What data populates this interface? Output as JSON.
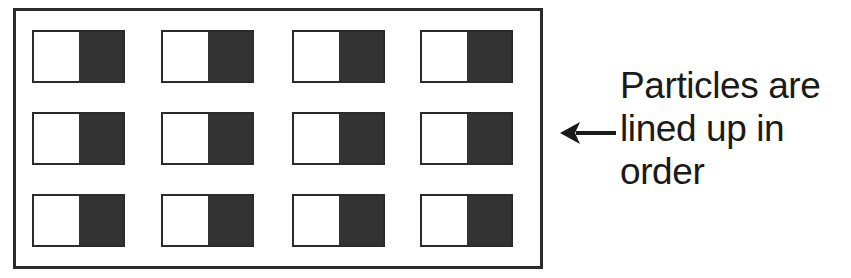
{
  "figure": {
    "background_color": "#ffffff"
  },
  "container": {
    "name": "particle-box",
    "border_color": "#2b2b2b",
    "fill_color": "#ffffff"
  },
  "particles": {
    "rows": 3,
    "columns": 4,
    "total": 12,
    "light_half_color": "#ffffff",
    "dark_half_color": "#333333",
    "border_color": "#2b2b2b",
    "items": [
      {
        "id": "particle-r1-c1",
        "row": 1,
        "column": 1
      },
      {
        "id": "particle-r1-c2",
        "row": 1,
        "column": 2
      },
      {
        "id": "particle-r1-c3",
        "row": 1,
        "column": 3
      },
      {
        "id": "particle-r1-c4",
        "row": 1,
        "column": 4
      },
      {
        "id": "particle-r2-c1",
        "row": 2,
        "column": 1
      },
      {
        "id": "particle-r2-c2",
        "row": 2,
        "column": 2
      },
      {
        "id": "particle-r2-c3",
        "row": 2,
        "column": 3
      },
      {
        "id": "particle-r2-c4",
        "row": 2,
        "column": 4
      },
      {
        "id": "particle-r3-c1",
        "row": 3,
        "column": 1
      },
      {
        "id": "particle-r3-c2",
        "row": 3,
        "column": 2
      },
      {
        "id": "particle-r3-c3",
        "row": 3,
        "column": 3
      },
      {
        "id": "particle-r3-c4",
        "row": 3,
        "column": 4
      }
    ]
  },
  "annotation": {
    "arrow_direction": "left",
    "arrow_color": "#1a1a1a",
    "text_color": "#1a1a1a",
    "lines": [
      "Particles are",
      "lined up in",
      "order"
    ],
    "full_text": "Particles are lined up in order"
  }
}
